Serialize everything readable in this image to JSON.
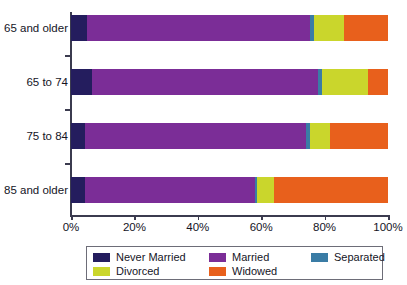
{
  "chart_data": {
    "type": "bar",
    "orientation": "horizontal",
    "stacked": true,
    "stacked_mode": "percent",
    "title": "",
    "subtitle": "",
    "xlabel": "",
    "ylabel": "",
    "xlim": [
      0,
      100
    ],
    "xticks": [
      0,
      20,
      40,
      60,
      80,
      100
    ],
    "xticklabels": [
      "0%",
      "20%",
      "40%",
      "60%",
      "80%",
      "100%"
    ],
    "grid": false,
    "legend_position": "bottom",
    "categories": [
      "65 and older",
      "65 to 74",
      "75 to 84",
      "85 and older"
    ],
    "series": [
      {
        "name": "Never Married",
        "color": "#241d5e",
        "values": [
          5.0,
          6.5,
          4.5,
          4.5
        ]
      },
      {
        "name": "Married",
        "color": "#7b2d97",
        "values": [
          70.5,
          71.3,
          69.5,
          53.5
        ]
      },
      {
        "name": "Separated",
        "color": "#3a7ca5",
        "values": [
          1.2,
          1.3,
          1.3,
          0.7
        ]
      },
      {
        "name": "Divorced",
        "color": "#cad62c",
        "values": [
          9.5,
          14.5,
          6.3,
          5.3
        ]
      },
      {
        "name": "Widowed",
        "color": "#e8601c",
        "values": [
          13.8,
          6.4,
          18.4,
          36.0
        ]
      }
    ],
    "legend_entries": [
      "Never Married",
      "Married",
      "Separated",
      "Divorced",
      "Widowed"
    ]
  },
  "colors": {
    "never_married": "#241d5e",
    "married": "#7b2d97",
    "separated": "#3a7ca5",
    "divorced": "#cad62c",
    "widowed": "#e8601c",
    "axis": "#3b3b4f",
    "text": "#15151f",
    "legend_border": "#6d6d78",
    "background": "#ffffff"
  }
}
